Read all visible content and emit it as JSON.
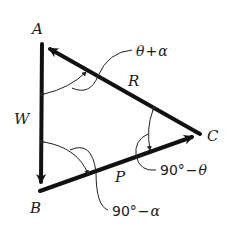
{
  "diagram": {
    "type": "force-triangle",
    "vertices": {
      "A": {
        "label": "A",
        "x": 42,
        "y": 44
      },
      "B": {
        "label": "B",
        "x": 40,
        "y": 191
      },
      "C": {
        "label": "C",
        "x": 200,
        "y": 134
      }
    },
    "edges": [
      {
        "name": "W",
        "label": "W",
        "from": "A",
        "to": "B",
        "arrow_at": "B"
      },
      {
        "name": "P",
        "label": "P",
        "from": "B",
        "to": "C",
        "arrow_at": "C"
      },
      {
        "name": "R",
        "label": "R",
        "from": "C",
        "to": "A",
        "arrow_at": "A"
      }
    ],
    "angles": [
      {
        "at": "A",
        "label_left": "θ",
        "label_op": "+",
        "label_right": "α"
      },
      {
        "at": "C",
        "label_left": "90°",
        "label_op": "−",
        "label_right": "θ"
      },
      {
        "at": "B",
        "label_left": "90°",
        "label_op": "−",
        "label_right": "α"
      }
    ],
    "colors": {
      "line": "#111111",
      "background": "#ffffff"
    }
  }
}
